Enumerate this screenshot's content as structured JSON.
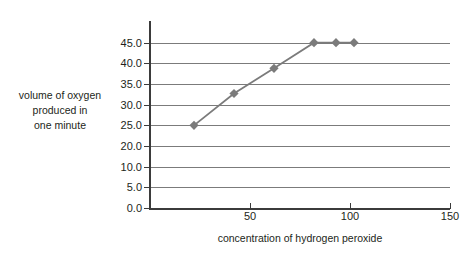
{
  "chart_data": {
    "type": "line",
    "title": "",
    "xlabel": "concentration of hydrogen peroxide",
    "ylabel": "volume of oxygen produced in one minute",
    "ylabel_lines": [
      "volume of oxygen",
      "produced in",
      "one minute"
    ],
    "x": [
      22,
      42,
      62,
      82,
      93,
      102
    ],
    "values": [
      20.0,
      27.7,
      33.8,
      40.0,
      40.0,
      40.0
    ],
    "series": [
      {
        "name": "volume of oxygen produced in one minute",
        "points": [
          {
            "x": 22,
            "y": 20.0
          },
          {
            "x": 42,
            "y": 27.7
          },
          {
            "x": 62,
            "y": 33.8
          },
          {
            "x": 82,
            "y": 40.0
          },
          {
            "x": 93,
            "y": 40.0
          },
          {
            "x": 102,
            "y": 40.0
          }
        ],
        "color": "#7b7b7b",
        "marker": "diamond"
      }
    ],
    "xlim": [
      0,
      150
    ],
    "ylim": [
      0,
      45
    ],
    "x_ticks": [
      0,
      50,
      100,
      150
    ],
    "x_tick_labels": [
      "",
      "50",
      "100",
      "150"
    ],
    "y_ticks": [
      0.0,
      5.0,
      10.0,
      20.0,
      25.0,
      30.0,
      35.0,
      40.0,
      45.0
    ],
    "y_tick_labels": [
      "0.0",
      "5.0",
      "10.0",
      "20.0",
      "25.0",
      "30.0",
      "35.0",
      "40.0",
      "45.0"
    ],
    "y_tick_positions": [
      0,
      5,
      10,
      15,
      20,
      25,
      30,
      35,
      40
    ],
    "grid": true,
    "legend": "none",
    "colors": {
      "line": "#7b7b7b",
      "marker": "#7b7b7b",
      "grid": "#7b7b7b",
      "axis": "#3b3b3b",
      "text": "#231f20",
      "background": "#ffffff"
    }
  }
}
